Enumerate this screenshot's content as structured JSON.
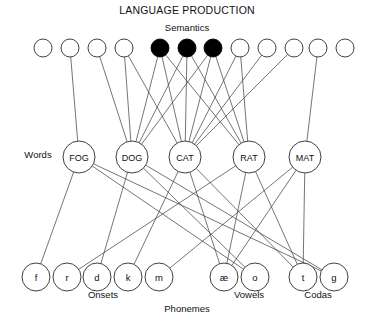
{
  "title": "LANGUAGE PRODUCTION",
  "layers": {
    "semantics": {
      "label": "Semantics",
      "label_x": 187,
      "label_y": 31,
      "y": 48,
      "radius": 9,
      "nodes": [
        {
          "id": "s1",
          "x": 43,
          "filled": false
        },
        {
          "id": "s2",
          "x": 70,
          "filled": false
        },
        {
          "id": "s3",
          "x": 97,
          "filled": false
        },
        {
          "id": "s4",
          "x": 124,
          "filled": false
        },
        {
          "id": "s5",
          "x": 160,
          "filled": true
        },
        {
          "id": "s6",
          "x": 187,
          "filled": true
        },
        {
          "id": "s7",
          "x": 213,
          "filled": true
        },
        {
          "id": "s8",
          "x": 240,
          "filled": false
        },
        {
          "id": "s9",
          "x": 267,
          "filled": false
        },
        {
          "id": "s10",
          "x": 294,
          "filled": false
        },
        {
          "id": "s11",
          "x": 318,
          "filled": false
        },
        {
          "id": "s12",
          "x": 345,
          "filled": false
        }
      ]
    },
    "words": {
      "label": "Words",
      "label_x": 38,
      "label_y": 158,
      "y": 157,
      "radius": 16,
      "nodes": [
        {
          "id": "FOG",
          "x": 79,
          "label": "FOG"
        },
        {
          "id": "DOG",
          "x": 132,
          "label": "DOG"
        },
        {
          "id": "CAT",
          "x": 185,
          "label": "CAT"
        },
        {
          "id": "RAT",
          "x": 249,
          "label": "RAT"
        },
        {
          "id": "MAT",
          "x": 305,
          "label": "MAT"
        }
      ]
    },
    "phonemes": {
      "label": "Phonemes",
      "label_x": 187,
      "label_y": 312,
      "y": 277,
      "radius": 14,
      "groups": [
        {
          "name": "Onsets",
          "label": "Onsets",
          "label_x": 103,
          "label_y": 298
        },
        {
          "name": "Vowels",
          "label": "Vowels",
          "label_x": 249,
          "label_y": 298
        },
        {
          "name": "Codas",
          "label": "Codas",
          "label_x": 318,
          "label_y": 298
        }
      ],
      "nodes": [
        {
          "id": "f",
          "x": 36,
          "label": "f",
          "group": "Onsets"
        },
        {
          "id": "r",
          "x": 67,
          "label": "r",
          "group": "Onsets"
        },
        {
          "id": "d",
          "x": 97,
          "label": "d",
          "group": "Onsets"
        },
        {
          "id": "k",
          "x": 128,
          "label": "k",
          "group": "Onsets"
        },
        {
          "id": "m",
          "x": 159,
          "label": "m",
          "group": "Onsets"
        },
        {
          "id": "ae",
          "x": 224,
          "label": "æ",
          "group": "Vowels"
        },
        {
          "id": "o",
          "x": 255,
          "label": "o",
          "group": "Vowels"
        },
        {
          "id": "t",
          "x": 303,
          "label": "t",
          "group": "Codas"
        },
        {
          "id": "g",
          "x": 334,
          "label": "g",
          "group": "Codas"
        }
      ]
    }
  },
  "edges": {
    "semantics_to_words": [
      {
        "from": "s2",
        "to": "FOG"
      },
      {
        "from": "s3",
        "to": "DOG"
      },
      {
        "from": "s4",
        "to": "CAT"
      },
      {
        "from": "s4",
        "to": "DOG"
      },
      {
        "from": "s5",
        "to": "DOG"
      },
      {
        "from": "s5",
        "to": "CAT"
      },
      {
        "from": "s5",
        "to": "RAT"
      },
      {
        "from": "s6",
        "to": "DOG"
      },
      {
        "from": "s6",
        "to": "CAT"
      },
      {
        "from": "s6",
        "to": "RAT"
      },
      {
        "from": "s7",
        "to": "DOG"
      },
      {
        "from": "s7",
        "to": "CAT"
      },
      {
        "from": "s7",
        "to": "RAT"
      },
      {
        "from": "s8",
        "to": "CAT"
      },
      {
        "from": "s8",
        "to": "RAT"
      },
      {
        "from": "s9",
        "to": "CAT"
      },
      {
        "from": "s10",
        "to": "CAT"
      },
      {
        "from": "s11",
        "to": "MAT"
      }
    ],
    "words_to_phonemes": [
      {
        "from": "FOG",
        "to": "f"
      },
      {
        "from": "FOG",
        "to": "o"
      },
      {
        "from": "FOG",
        "to": "g"
      },
      {
        "from": "DOG",
        "to": "d"
      },
      {
        "from": "DOG",
        "to": "o"
      },
      {
        "from": "DOG",
        "to": "g"
      },
      {
        "from": "CAT",
        "to": "k"
      },
      {
        "from": "CAT",
        "to": "ae"
      },
      {
        "from": "CAT",
        "to": "t"
      },
      {
        "from": "RAT",
        "to": "r"
      },
      {
        "from": "RAT",
        "to": "ae"
      },
      {
        "from": "RAT",
        "to": "t"
      },
      {
        "from": "MAT",
        "to": "m"
      },
      {
        "from": "MAT",
        "to": "ae"
      },
      {
        "from": "MAT",
        "to": "t"
      }
    ]
  },
  "colors": {
    "stroke": "#2b2b2b",
    "edge": "#3a3a3a",
    "node_fill": "#ffffff",
    "node_active_fill": "#000000",
    "background": "#ffffff"
  }
}
